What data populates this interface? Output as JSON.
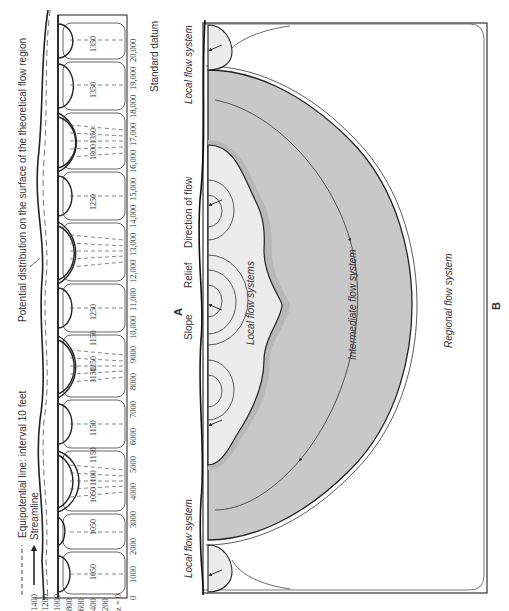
{
  "figure": {
    "orientation": "rotated 90 degrees counter-clockwise",
    "panel_a": {
      "label": "A",
      "legend": {
        "equipotential": "Equipotential line: interval 10 feet",
        "streamline": "Streamline"
      },
      "annotation_surface": "Potential distribution on the surface of the theoretical flow region",
      "annotation_datum": "Standard datum",
      "z_axis": {
        "ticks": [
          "1400",
          "1200",
          "1000",
          "800",
          "600",
          "400",
          "200",
          "z = 0"
        ]
      },
      "x_axis": {
        "ticks": [
          "0",
          "1000",
          "2000",
          "3000",
          "4000",
          "5000",
          "6000",
          "7000",
          "8000",
          "9000",
          "10,000",
          "11,000",
          "12,000",
          "13,000",
          "14,000",
          "15,000",
          "16,000",
          "17,000",
          "18,000",
          "19,000",
          "20,000"
        ]
      },
      "equipotential_labels": [
        "1050",
        "1050",
        "1050",
        "1100",
        "1150",
        "1150",
        "1150",
        "1250",
        "1150",
        "1250",
        "1250",
        "1300",
        "1350",
        "1350",
        "1350"
      ]
    },
    "panel_b": {
      "label": "B",
      "labels": {
        "local_flow_left": "Local flow system",
        "slope": "Slope",
        "relief": "Relief",
        "direction_of_flow": "Direction of flow",
        "local_flow_right": "Local flow system",
        "local_flow_systems": "Local flow systems",
        "intermediate": "Intermediate flow system",
        "regional": "Regional flow system"
      }
    },
    "colors": {
      "line": "#2a2a2a",
      "intermediate_fill": "#c8c8c8",
      "local_fill": "#ececec",
      "band_fill": "#b4b4b4",
      "background": "#ffffff"
    }
  }
}
